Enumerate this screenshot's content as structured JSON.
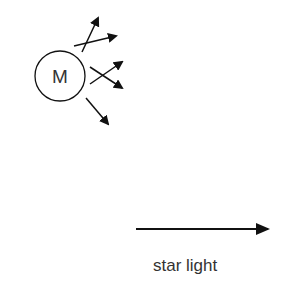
{
  "diagram": {
    "molecule": {
      "label": "M",
      "center": [
        60,
        76
      ],
      "radius": 25
    },
    "scattered_arrows": [
      {
        "from": [
          82,
          52
        ],
        "to": [
          98,
          18
        ]
      },
      {
        "from": [
          74,
          46
        ],
        "to": [
          116,
          36
        ]
      },
      {
        "from": [
          90,
          84
        ],
        "to": [
          122,
          62
        ]
      },
      {
        "from": [
          90,
          67
        ],
        "to": [
          122,
          88
        ]
      },
      {
        "from": [
          86,
          98
        ],
        "to": [
          108,
          124
        ]
      }
    ],
    "incoming_light": {
      "from": [
        136,
        229
      ],
      "to": [
        268,
        229
      ],
      "label": "star light"
    },
    "colors": {
      "stroke": "#111111",
      "text": "#333333",
      "background": "#ffffff"
    }
  }
}
